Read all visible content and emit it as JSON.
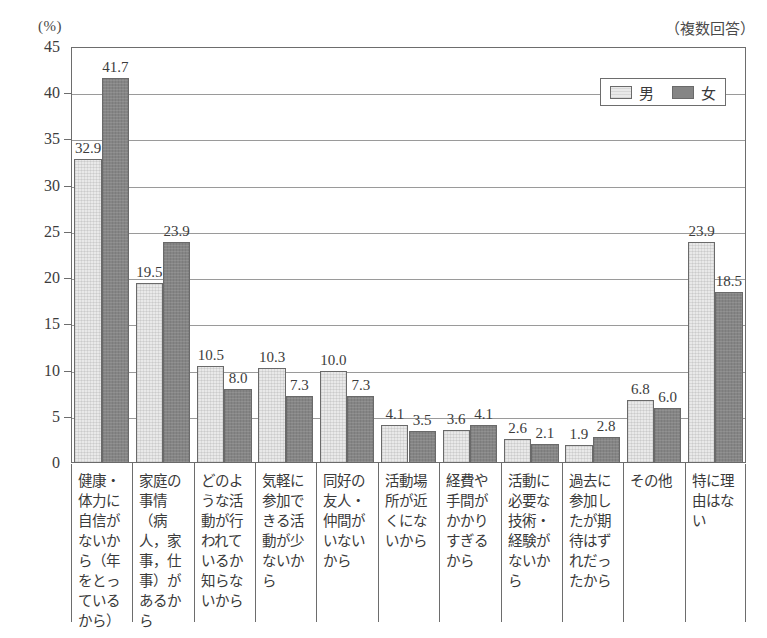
{
  "chart_data": {
    "type": "bar",
    "title": "",
    "subtitle": "",
    "note": "（複数回答）",
    "unit_label": "(%)",
    "xlabel": "",
    "ylabel": "",
    "ylim": [
      0,
      45
    ],
    "yticks": [
      0,
      5,
      10,
      15,
      20,
      25,
      30,
      35,
      40,
      45
    ],
    "ytick_labels": [
      "0",
      "5",
      "10",
      "15",
      "20",
      "25",
      "30",
      "35",
      "40",
      "45"
    ],
    "grid": true,
    "legend_position": "top-right",
    "categories": [
      "健康・体力に自信がないから（年をとっているから）",
      "家庭の事情（病人，家事，仕事）があるから",
      "どのような活動が行われているか知らないから",
      "気軽に参加できる活動が少ないから",
      "同好の友人・仲間がいないから",
      "活動場所が近くにないから",
      "経費や手間がかかりすぎるから",
      "活動に必要な技術・経験がないから",
      "過去に参加したが期待はずれだったから",
      "その他",
      "特に理由はない"
    ],
    "series": [
      {
        "name": "男",
        "color": "#e9e9e9",
        "values": [
          32.9,
          19.5,
          10.5,
          10.3,
          10.0,
          4.1,
          3.6,
          2.6,
          1.9,
          6.8,
          23.9
        ]
      },
      {
        "name": "女",
        "color": "#858585",
        "values": [
          41.7,
          23.9,
          8.0,
          7.3,
          7.3,
          3.5,
          4.1,
          2.1,
          2.8,
          6.0,
          18.5
        ]
      }
    ]
  }
}
